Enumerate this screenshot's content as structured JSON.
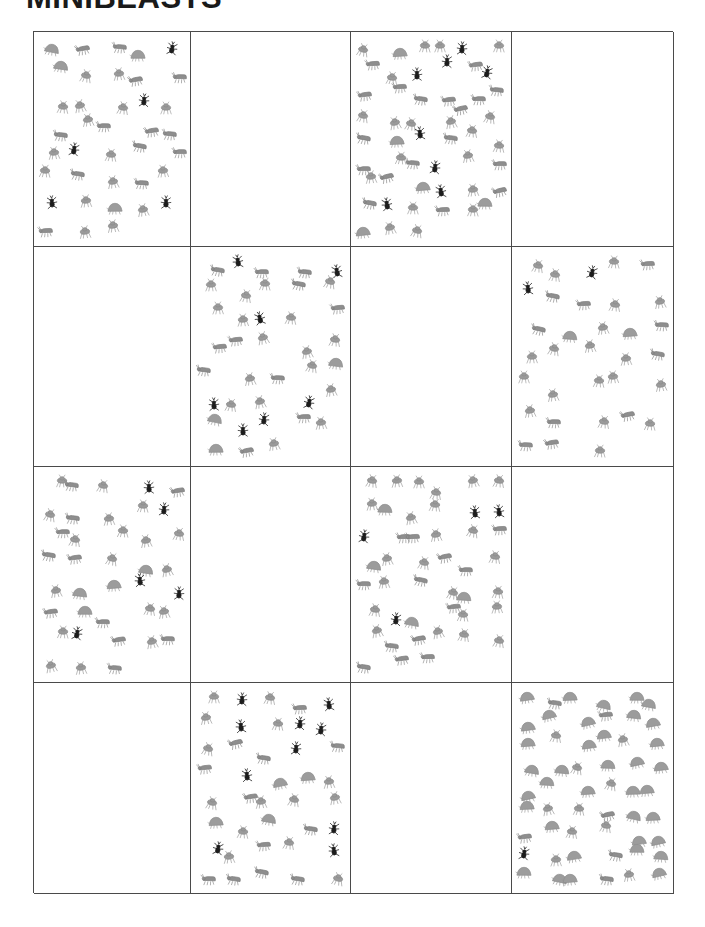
{
  "document": {
    "title": "MINIBEASTS",
    "title_clipped": true
  },
  "colors": {
    "page_background": "#ffffff",
    "grid_line": "#4a4a4a",
    "title_text": "#1a1a1a",
    "spider_dark": "#1c1c1c",
    "beetle_gray": "#8e8e8e",
    "ant_gray": "#9a9a9a",
    "louse_gray": "#9c9c9c"
  },
  "grid": {
    "rows": 4,
    "columns": 4,
    "pattern": "checkerboard",
    "left": 33,
    "top": 31,
    "width": 640,
    "height": 862,
    "column_widths": [
      157,
      160,
      161,
      162
    ],
    "row_heights": [
      215,
      220,
      216,
      211
    ]
  },
  "legend": {
    "types": [
      {
        "key": "spider",
        "label": "dark spider"
      },
      {
        "key": "beetle",
        "label": "gray beetle"
      },
      {
        "key": "ant",
        "label": "gray ant"
      },
      {
        "key": "louse",
        "label": "gray woodlouse"
      }
    ]
  },
  "chart_data": {
    "type": "scatter",
    "title": "MINIBEASTS",
    "xlabel": "",
    "ylabel": "",
    "grid": true,
    "legend_position": "none",
    "categories": [
      "spider",
      "beetle",
      "ant",
      "louse"
    ],
    "cells": [
      {
        "row": 1,
        "col": 1,
        "filled": true,
        "count": 38,
        "counts": {
          "spider": 5,
          "beetle": 13,
          "ant": 16,
          "louse": 4
        }
      },
      {
        "row": 1,
        "col": 2,
        "filled": false,
        "count": 0,
        "counts": {
          "spider": 0,
          "beetle": 0,
          "ant": 0,
          "louse": 0
        }
      },
      {
        "row": 1,
        "col": 3,
        "filled": true,
        "count": 51,
        "counts": {
          "spider": 8,
          "beetle": 18,
          "ant": 20,
          "louse": 5
        }
      },
      {
        "row": 1,
        "col": 4,
        "filled": false,
        "count": 0,
        "counts": {
          "spider": 0,
          "beetle": 0,
          "ant": 0,
          "louse": 0
        }
      },
      {
        "row": 2,
        "col": 1,
        "filled": false,
        "count": 0,
        "counts": {
          "spider": 0,
          "beetle": 0,
          "ant": 0,
          "louse": 0
        }
      },
      {
        "row": 2,
        "col": 2,
        "filled": true,
        "count": 38,
        "counts": {
          "spider": 7,
          "beetle": 11,
          "ant": 17,
          "louse": 3
        }
      },
      {
        "row": 2,
        "col": 3,
        "filled": false,
        "count": 0,
        "counts": {
          "spider": 0,
          "beetle": 0,
          "ant": 0,
          "louse": 0
        }
      },
      {
        "row": 2,
        "col": 4,
        "filled": true,
        "count": 33,
        "counts": {
          "spider": 2,
          "beetle": 10,
          "ant": 19,
          "louse": 2
        }
      },
      {
        "row": 3,
        "col": 1,
        "filled": true,
        "count": 38,
        "counts": {
          "spider": 5,
          "beetle": 11,
          "ant": 18,
          "louse": 4
        }
      },
      {
        "row": 3,
        "col": 2,
        "filled": false,
        "count": 0,
        "counts": {
          "spider": 0,
          "beetle": 0,
          "ant": 0,
          "louse": 0
        }
      },
      {
        "row": 3,
        "col": 3,
        "filled": true,
        "count": 45,
        "counts": {
          "spider": 4,
          "beetle": 13,
          "ant": 24,
          "louse": 4
        }
      },
      {
        "row": 3,
        "col": 4,
        "filled": false,
        "count": 0,
        "counts": {
          "spider": 0,
          "beetle": 0,
          "ant": 0,
          "louse": 0
        }
      },
      {
        "row": 4,
        "col": 1,
        "filled": false,
        "count": 0,
        "counts": {
          "spider": 0,
          "beetle": 0,
          "ant": 0,
          "louse": 0
        }
      },
      {
        "row": 4,
        "col": 2,
        "filled": true,
        "count": 40,
        "counts": {
          "spider": 10,
          "beetle": 12,
          "ant": 14,
          "louse": 4
        }
      },
      {
        "row": 4,
        "col": 3,
        "filled": false,
        "count": 0,
        "counts": {
          "spider": 0,
          "beetle": 0,
          "ant": 0,
          "louse": 0
        }
      },
      {
        "row": 4,
        "col": 4,
        "filled": true,
        "count": 54,
        "counts": {
          "spider": 1,
          "beetle": 6,
          "ant": 10,
          "louse": 37
        }
      }
    ]
  }
}
